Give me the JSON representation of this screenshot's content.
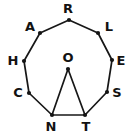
{
  "figure": {
    "shape_name": "nonagon",
    "background_color": "#ffffff",
    "stroke_color": "#171717",
    "label_color": "#121212",
    "dot_color": "#141414",
    "width": 131,
    "height": 134
  },
  "center": {
    "id": "O",
    "label": "O",
    "x": 68,
    "y": 69,
    "label_x": 68,
    "label_y": 57
  },
  "vertices": [
    {
      "id": "R",
      "label": "R",
      "x": 69,
      "y": 20,
      "label_x": 68,
      "label_y": 8
    },
    {
      "id": "L",
      "label": "L",
      "x": 98,
      "y": 33,
      "label_x": 109,
      "label_y": 26
    },
    {
      "id": "E",
      "label": "E",
      "x": 112,
      "y": 60,
      "label_x": 121,
      "label_y": 60
    },
    {
      "id": "S",
      "label": "S",
      "x": 107,
      "y": 92,
      "label_x": 117,
      "label_y": 92
    },
    {
      "id": "T",
      "label": "T",
      "x": 85,
      "y": 115,
      "label_x": 86,
      "label_y": 126
    },
    {
      "id": "N",
      "label": "N",
      "x": 52,
      "y": 115,
      "label_x": 51,
      "label_y": 126
    },
    {
      "id": "C",
      "label": "C",
      "x": 29,
      "y": 93,
      "label_x": 18,
      "label_y": 92
    },
    {
      "id": "H",
      "label": "H",
      "x": 24,
      "y": 61,
      "label_x": 13,
      "label_y": 60
    },
    {
      "id": "A",
      "label": "A",
      "x": 40,
      "y": 33,
      "label_x": 30,
      "label_y": 26
    }
  ],
  "polygon_edges": [
    {
      "from": "R",
      "to": "L"
    },
    {
      "from": "L",
      "to": "E"
    },
    {
      "from": "E",
      "to": "S"
    },
    {
      "from": "S",
      "to": "T"
    },
    {
      "from": "T",
      "to": "N"
    },
    {
      "from": "N",
      "to": "C"
    },
    {
      "from": "C",
      "to": "H"
    },
    {
      "from": "H",
      "to": "A"
    },
    {
      "from": "A",
      "to": "R"
    }
  ],
  "chords": [
    {
      "from": "O",
      "to": "N"
    },
    {
      "from": "O",
      "to": "T"
    }
  ]
}
